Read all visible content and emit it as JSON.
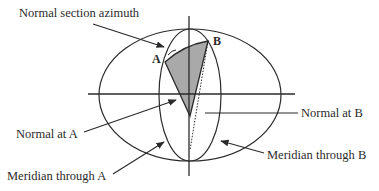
{
  "figure": {
    "type": "geodesy-diagram",
    "labels": {
      "normal_section_azimuth": "Normal section azimuth",
      "point_a": "A",
      "point_b": "B",
      "normal_at_a": "Normal at A",
      "normal_at_b": "Normal at B",
      "meridian_through_a": "Meridian through A",
      "meridian_through_b": "Meridian through B"
    },
    "colors": {
      "stroke": "#2a2a2a",
      "shade": "#a9a9a9",
      "background": "#ffffff"
    }
  }
}
